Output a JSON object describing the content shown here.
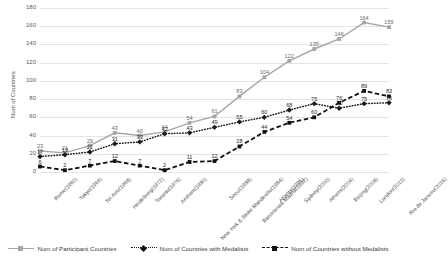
{
  "chart_data": {
    "type": "line",
    "title": "",
    "xlabel": "",
    "ylabel": "Num of Countries",
    "ylim": [
      0,
      180
    ],
    "yticks": [
      0,
      20,
      40,
      60,
      80,
      100,
      120,
      140,
      160,
      180
    ],
    "grid": true,
    "legend_position": "bottom",
    "categories": [
      "Rome(1960)",
      "Tokyo(1964)",
      "Tel Aviv(1968)",
      "Heidelberg(1972)",
      "Toronto(1976)",
      "Arnhem(1980)",
      "New York &\nStoke Mandeville(1984)",
      "Seoul(1988)",
      "Barcelona& Madrid(1992)",
      "Atlanta(1996)",
      "Sydney(2000)",
      "Athens(2004)",
      "Beijing(2008)",
      "London(2012)",
      "Rio de Janeiro(2016)"
    ],
    "series": [
      {
        "name": "Num of Participant Countries",
        "color": "#a6a6a6",
        "style": "solid",
        "marker": "square",
        "values": [
          23,
          21,
          29,
          43,
          40,
          44,
          54,
          61,
          83,
          104,
          122,
          135,
          146,
          164,
          159
        ]
      },
      {
        "name": "Num of Countries with Medalists",
        "color": "#1a1a1a",
        "style": "dotted",
        "marker": "diamond",
        "values": [
          17,
          19,
          22,
          31,
          33,
          42,
          43,
          49,
          55,
          60,
          68,
          75,
          70,
          75,
          76
        ]
      },
      {
        "name": "Num of Countries without Medalists",
        "color": "#111111",
        "style": "dashed",
        "marker": "square",
        "values": [
          6,
          2,
          7,
          12,
          7,
          2,
          11,
          12,
          28,
          44,
          54,
          60,
          76,
          89,
          83
        ]
      }
    ]
  },
  "legend": {
    "items": [
      "Num of Participant Countries",
      "Num of Countries with Medalists",
      "Num of Countries without Medalists"
    ]
  },
  "axis": {
    "y_title": "Num of Countries"
  }
}
